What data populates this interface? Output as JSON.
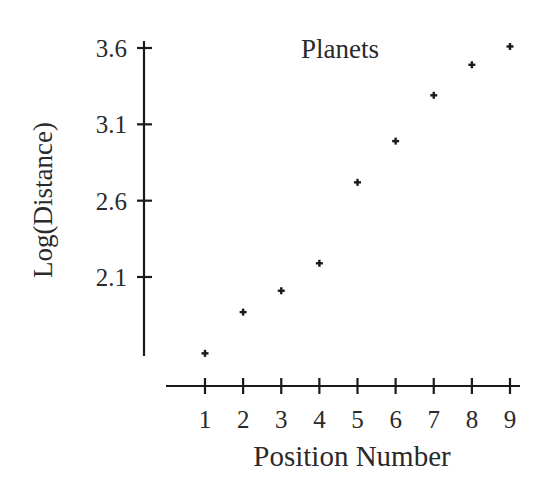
{
  "chart_data": {
    "type": "scatter",
    "title": "Planets",
    "xlabel": "Position Number",
    "ylabel": "Log(Distance)",
    "x": [
      1,
      2,
      3,
      4,
      5,
      6,
      7,
      8,
      9
    ],
    "series": [
      {
        "name": "Planets",
        "marker": "plus",
        "values": [
          1.6,
          1.87,
          2.01,
          2.19,
          2.72,
          2.99,
          3.29,
          3.49,
          3.61
        ]
      }
    ],
    "xticks": [
      1,
      2,
      3,
      4,
      5,
      6,
      7,
      8,
      9
    ],
    "xtick_labels": [
      "1",
      "2",
      "3",
      "4",
      "5",
      "6",
      "7",
      "8",
      "9"
    ],
    "yticks": [
      2.1,
      2.6,
      3.1,
      3.6
    ],
    "ytick_labels": [
      "2.1",
      "2.6",
      "3.1",
      "3.6"
    ],
    "xlim": [
      0,
      9.25
    ],
    "ylim": [
      1.46,
      3.64
    ],
    "grid": false,
    "legend": null
  },
  "colors": {
    "axis": "#1a1a1a",
    "marker": "#1a1a1a",
    "text": "#2a2a2a",
    "background": "#ffffff"
  }
}
